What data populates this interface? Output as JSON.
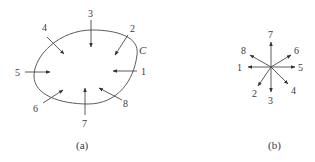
{
  "figure": {
    "panel_a": {
      "caption": "(a)",
      "curve_label": "C",
      "arrows": [
        {
          "label": "1",
          "direction": "inward-from-right"
        },
        {
          "label": "2",
          "direction": "inward-from-upper-right"
        },
        {
          "label": "3",
          "direction": "inward-from-top"
        },
        {
          "label": "4",
          "direction": "inward-from-upper-left"
        },
        {
          "label": "5",
          "direction": "inward-from-left"
        },
        {
          "label": "6",
          "direction": "inward-from-lower-left"
        },
        {
          "label": "7",
          "direction": "inward-from-bottom"
        },
        {
          "label": "8",
          "direction": "inward-from-lower-right"
        }
      ]
    },
    "panel_b": {
      "caption": "(b)",
      "arrows": [
        {
          "label": "1",
          "direction": "left"
        },
        {
          "label": "2",
          "direction": "down-left"
        },
        {
          "label": "3",
          "direction": "down"
        },
        {
          "label": "4",
          "direction": "down-right"
        },
        {
          "label": "5",
          "direction": "right"
        },
        {
          "label": "6",
          "direction": "up-right"
        },
        {
          "label": "7",
          "direction": "up"
        },
        {
          "label": "8",
          "direction": "up-left"
        }
      ]
    }
  }
}
